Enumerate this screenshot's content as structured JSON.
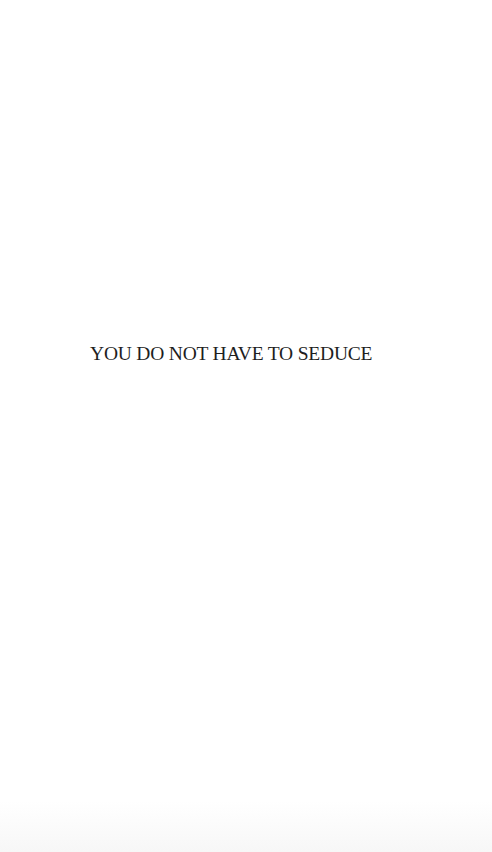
{
  "page": {
    "title": "YOU DO NOT HAVE TO SEDUCE"
  }
}
